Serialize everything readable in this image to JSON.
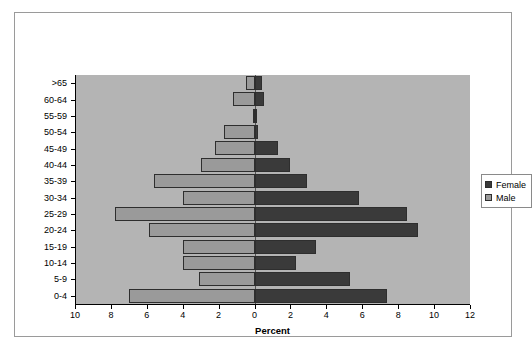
{
  "chart_data": {
    "type": "bar",
    "chart_style": "population-pyramid",
    "title": "",
    "xlabel": "Percent",
    "ylabel": "",
    "categories": [
      "0-4",
      "5-9",
      "10-14",
      "15-19",
      "20-24",
      "25-29",
      "30-34",
      "35-39",
      "40-44",
      "45-49",
      "50-54",
      "55-59",
      "60-64",
      ">65"
    ],
    "series": [
      {
        "name": "Male",
        "direction": "left",
        "color": "#9a9a9a",
        "values": [
          7.0,
          3.1,
          4.0,
          4.0,
          5.9,
          7.8,
          4.0,
          5.6,
          3.0,
          2.2,
          1.7,
          0.1,
          1.2,
          0.5
        ]
      },
      {
        "name": "Female",
        "direction": "right",
        "color": "#3a3a3a",
        "values": [
          7.4,
          5.3,
          2.3,
          3.4,
          9.1,
          8.5,
          5.8,
          2.9,
          2.0,
          1.3,
          0.2,
          0.1,
          0.5,
          0.4
        ]
      }
    ],
    "xlim": [
      -10,
      12
    ],
    "x_ticks": [
      -10,
      -8,
      -6,
      -4,
      -2,
      0,
      2,
      4,
      6,
      8,
      10,
      12
    ],
    "x_tick_labels": [
      "10",
      "8",
      "6",
      "4",
      "2",
      "0",
      "2",
      "4",
      "6",
      "8",
      "10",
      "12"
    ],
    "grid": false,
    "legend_position": "right"
  },
  "legend": {
    "entries": [
      {
        "label": "Female",
        "color": "#3a3a3a"
      },
      {
        "label": "Male",
        "color": "#9a9a9a"
      }
    ]
  },
  "axis": {
    "x_title": "Percent"
  },
  "colors": {
    "plot_background": "#b4b4b4",
    "page_background": "#ffffff",
    "female": "#3a3a3a",
    "male": "#9a9a9a",
    "bar_outline": "#2e2e2e",
    "axis": "#000000"
  }
}
